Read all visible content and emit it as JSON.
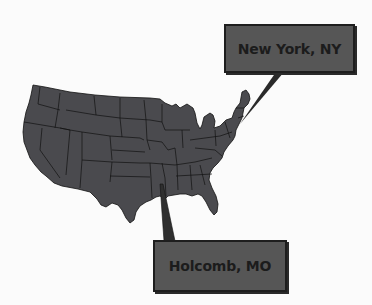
{
  "figure": {
    "type": "us-map-with-callouts",
    "map": {
      "region": "Contiguous United States",
      "fill_color": "#4a4a4e",
      "border_color": "#111111"
    },
    "callouts": [
      {
        "id": "new-york",
        "label": "New York, NY",
        "point_x": 240,
        "point_y": 123
      },
      {
        "id": "holcomb",
        "label": "Holcomb, MO",
        "point_x": 161,
        "point_y": 185
      }
    ],
    "colors": {
      "background": "#fbfbfb",
      "callout_fill": "#565656",
      "callout_border": "#1e1e1e",
      "callout_text": "#1c1c1c"
    }
  }
}
